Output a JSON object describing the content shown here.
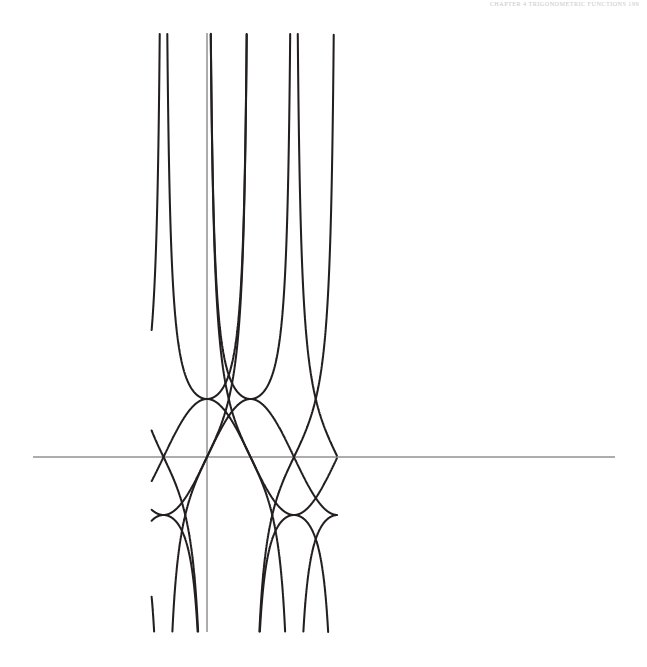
{
  "header": {
    "running_head": "CHAPTER 4  TRIGONOMETRIC FUNCTIONS   199"
  },
  "figure": {
    "name": "trigonometric-functions-graph",
    "background": "#ffffff",
    "curve_color": "#231f20",
    "axis_color": "#5a5a5a"
  },
  "chart_data": {
    "type": "line",
    "title": "",
    "subtitle": "",
    "xlabel": "",
    "ylabel": "",
    "grid": false,
    "legend_position": "none",
    "axes": {
      "x_axis_visible": true,
      "y_axis_visible": true,
      "origin_px": [
        207,
        457
      ],
      "pi_in_px": 87,
      "unit_y_px": 58,
      "x_axis_px_range": [
        33,
        615
      ],
      "y_axis_px_range": [
        33,
        632
      ],
      "xlim_radians": [
        -2.0,
        4.69
      ],
      "ylim_units": [
        -3.0,
        7.31
      ]
    },
    "series": [
      {
        "name": "sin(x)",
        "kind": "bounded",
        "amplitude": 1,
        "period_radians": 6.2832,
        "phase_radians": 0,
        "asymptotes_radians": []
      },
      {
        "name": "cos(x)",
        "kind": "bounded",
        "amplitude": 1,
        "period_radians": 6.2832,
        "phase_radians": 1.5708,
        "asymptotes_radians": []
      },
      {
        "name": "tan(x)",
        "kind": "unbounded",
        "period_radians": 3.1416,
        "asymptotes_radians": [
          -1.5708,
          1.5708,
          4.7124
        ]
      },
      {
        "name": "cot(x)",
        "kind": "unbounded",
        "period_radians": 3.1416,
        "asymptotes_radians": [
          -3.1416,
          0,
          3.1416
        ]
      },
      {
        "name": "sec(x)",
        "kind": "unbounded",
        "period_radians": 6.2832,
        "asymptotes_radians": [
          -1.5708,
          1.5708,
          4.7124
        ]
      },
      {
        "name": "csc(x)",
        "kind": "unbounded",
        "period_radians": 6.2832,
        "asymptotes_radians": [
          -3.1416,
          0,
          3.1416
        ]
      }
    ],
    "key_points": {
      "x_axis_zero_crossings_px": [
        120,
        207,
        292,
        380,
        467,
        555
      ],
      "sine_peak_px_y": 399,
      "sine_trough_px_y": 515,
      "curve_top_clip_px_y": 33,
      "curve_bottom_clip_px_y": 632
    }
  }
}
